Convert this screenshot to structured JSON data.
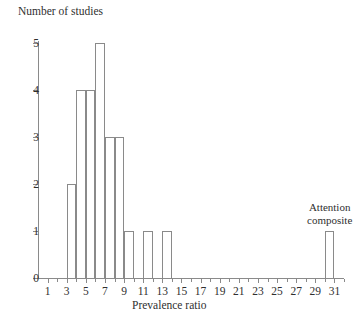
{
  "chart_data": {
    "type": "bar",
    "title": "",
    "xlabel": "Prevalence ratio",
    "ylabel": "Number of studies",
    "xlim": [
      0,
      32
    ],
    "ylim": [
      0,
      5
    ],
    "grid": false,
    "legend": null,
    "bin_width": 1,
    "categories": [
      3,
      4,
      5,
      6,
      7,
      8,
      9,
      11,
      13,
      31
    ],
    "values": [
      2,
      4,
      4,
      5,
      3,
      3,
      1,
      1,
      1,
      1
    ],
    "bars": [
      {
        "bin_start": 3.0,
        "bin_end": 4.0,
        "center": 3.5,
        "value": 2
      },
      {
        "bin_start": 4.0,
        "bin_end": 5.0,
        "center": 4.5,
        "value": 4
      },
      {
        "bin_start": 5.0,
        "bin_end": 6.0,
        "center": 5.5,
        "value": 4
      },
      {
        "bin_start": 6.0,
        "bin_end": 7.0,
        "center": 6.5,
        "value": 5
      },
      {
        "bin_start": 7.0,
        "bin_end": 8.0,
        "center": 7.5,
        "value": 3
      },
      {
        "bin_start": 8.0,
        "bin_end": 9.0,
        "center": 8.5,
        "value": 3
      },
      {
        "bin_start": 9.0,
        "bin_end": 10.0,
        "center": 9.5,
        "value": 1
      },
      {
        "bin_start": 11.0,
        "bin_end": 12.0,
        "center": 11.5,
        "value": 1
      },
      {
        "bin_start": 13.0,
        "bin_end": 14.0,
        "center": 13.5,
        "value": 1
      },
      {
        "bin_start": 30.0,
        "bin_end": 31.0,
        "center": 30.5,
        "value": 1
      }
    ],
    "yticks": [
      0,
      1,
      2,
      3,
      4,
      5
    ],
    "ytick_labels": [
      "0",
      "1",
      "2",
      "3",
      "4",
      "5"
    ],
    "xticks": [
      1,
      3,
      5,
      7,
      9,
      11,
      13,
      15,
      17,
      19,
      21,
      23,
      25,
      27,
      29,
      31
    ],
    "xtick_labels": [
      "1",
      "3",
      "5",
      "7",
      "9",
      "11",
      "13",
      "15",
      "17",
      "19",
      "21",
      "23",
      "25",
      "27",
      "29",
      "31"
    ],
    "xticks_minor": [
      2,
      4,
      6,
      8,
      10,
      12,
      14,
      16,
      18,
      20,
      22,
      24,
      26,
      28,
      30,
      32
    ],
    "annotations": [
      {
        "text_line1": "Attention",
        "text_line2": "composite",
        "target_bin_center": 30.5,
        "value": 1
      }
    ],
    "colors": {
      "bar_fill": "#ffffff",
      "bar_stroke": "#8a8a8a",
      "axis": "#8a8a8a",
      "text": "#2f2f2f",
      "background": "#ffffff"
    }
  }
}
